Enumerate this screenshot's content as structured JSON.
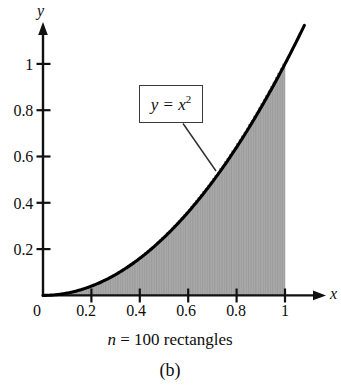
{
  "figure": {
    "panel_label": "(b)",
    "caption_math": "n",
    "caption_equals": " = ",
    "caption_rest": "100 rectangles",
    "caption_full": "n = 100 rectangles",
    "curve_label": {
      "lhs": "y",
      "equals": " = ",
      "base": "x",
      "exponent": "2",
      "full": "y = x2"
    },
    "colors": {
      "axis": "#111111",
      "curve": "#000000",
      "fill": "#a8a8a8",
      "rect_stroke": "#8e8e8e",
      "label_box_border": "#3b3b3b",
      "background": "#ffffff",
      "text": "#0d0d0d"
    }
  },
  "chart_data": {
    "type": "area",
    "title": "",
    "subtitle": "n = 100 rectangles",
    "annotations": [
      "y = x^2"
    ],
    "xlabel": "x",
    "ylabel": "y",
    "xlim": [
      0,
      1.08
    ],
    "ylim": [
      0,
      1.12
    ],
    "xticks": [
      0,
      0.2,
      0.4,
      0.6,
      0.8,
      1
    ],
    "xticklabels": [
      "0",
      "0.2",
      "0.4",
      "0.6",
      "0.8",
      "1"
    ],
    "yticks": [
      0.2,
      0.4,
      0.6,
      0.8,
      1
    ],
    "yticklabels": [
      "0.2",
      "0.4",
      "0.6",
      "0.8",
      "1"
    ],
    "grid": false,
    "legend": "none",
    "function": "y = x^2",
    "riemann": {
      "n": 100,
      "method": "right-endpoint circumscribed rectangles",
      "interval": [
        0,
        1
      ],
      "width": 0.01,
      "shaded_region": "area under y = x^2 from x = 0 to x = 1",
      "exact_area": 0.333333
    },
    "x": [
      0,
      0.05,
      0.1,
      0.15,
      0.2,
      0.25,
      0.3,
      0.35,
      0.4,
      0.45,
      0.5,
      0.55,
      0.6,
      0.65,
      0.7,
      0.75,
      0.8,
      0.85,
      0.9,
      0.95,
      1,
      1.05
    ],
    "y": [
      0,
      0.0025,
      0.01,
      0.0225,
      0.04,
      0.0625,
      0.09,
      0.1225,
      0.16,
      0.2025,
      0.25,
      0.3025,
      0.36,
      0.4225,
      0.49,
      0.5625,
      0.64,
      0.7225,
      0.81,
      0.9025,
      1,
      1.1025
    ]
  }
}
